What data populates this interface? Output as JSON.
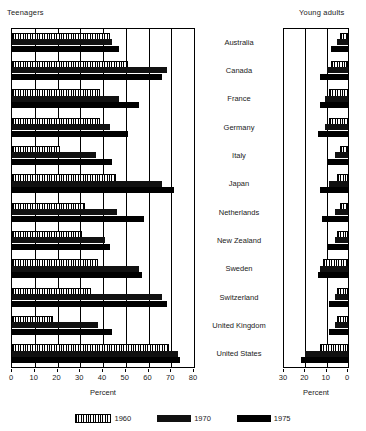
{
  "panels": {
    "left": {
      "title": "Teenagers",
      "axis_label": "Percent",
      "ticks": [
        "0",
        "10",
        "20",
        "30",
        "40",
        "50",
        "60",
        "70",
        "80"
      ]
    },
    "right": {
      "title": "Young adults",
      "axis_label": "Percent",
      "ticks": [
        "30",
        "20",
        "10",
        "0"
      ]
    }
  },
  "legend": [
    {
      "key": "1960",
      "label": "1960",
      "pattern": "hatched",
      "color": "#ffffff"
    },
    {
      "key": "1970",
      "label": "1970",
      "pattern": "solid",
      "color": "#111111"
    },
    {
      "key": "1975",
      "label": "1975",
      "pattern": "solid",
      "color": "#000000"
    }
  ],
  "countries": [
    "Australia",
    "Canada",
    "France",
    "Germany",
    "Italy",
    "Japan",
    "Netherlands",
    "New Zealand",
    "Sweden",
    "Switzerland",
    "United Kingdom",
    "United States"
  ],
  "chart_data": {
    "type": "bar",
    "title": "",
    "orientation": "horizontal",
    "grid": true,
    "legend_position": "bottom",
    "panels": [
      {
        "name": "Teenagers",
        "xlabel": "Percent",
        "xlim": [
          0,
          80
        ],
        "xticks": [
          0,
          10,
          20,
          30,
          40,
          50,
          60,
          70,
          80
        ],
        "direction": "left-to-right",
        "categories": [
          "Australia",
          "Canada",
          "France",
          "Germany",
          "Italy",
          "Japan",
          "Netherlands",
          "New Zealand",
          "Sweden",
          "Switzerland",
          "United Kingdom",
          "United States"
        ],
        "series": [
          {
            "name": "1960",
            "values": [
              42,
              50,
              38,
              38,
              20,
              45,
              31,
              30,
              37,
              34,
              17,
              68
            ]
          },
          {
            "name": "1970",
            "values": [
              44,
              68,
              47,
              43,
              37,
              66,
              46,
              41,
              56,
              66,
              38,
              73
            ]
          },
          {
            "name": "1975",
            "values": [
              47,
              66,
              56,
              51,
              44,
              71,
              58,
              43,
              57,
              68,
              44,
              74
            ]
          }
        ]
      },
      {
        "name": "Young adults",
        "xlabel": "Percent",
        "xlim": [
          0,
          30
        ],
        "xticks": [
          30,
          20,
          10,
          0
        ],
        "direction": "right-to-left",
        "categories": [
          "Australia",
          "Canada",
          "France",
          "Germany",
          "Italy",
          "Japan",
          "Netherlands",
          "New Zealand",
          "Sweden",
          "Switzerland",
          "United Kingdom",
          "United States"
        ],
        "series": [
          {
            "name": "1960",
            "values": [
              3,
              7,
              8,
              8,
              3,
              4,
              3,
              4,
              11,
              4,
              4,
              12
            ]
          },
          {
            "name": "1970",
            "values": [
              5,
              10,
              11,
              11,
              6,
              9,
              6,
              6,
              13,
              6,
              6,
              20
            ]
          },
          {
            "name": "1975",
            "values": [
              8,
              13,
              13,
              14,
              10,
              13,
              12,
              10,
              14,
              9,
              9,
              22
            ]
          }
        ]
      }
    ]
  }
}
